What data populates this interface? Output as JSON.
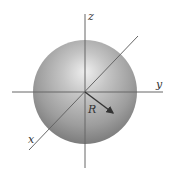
{
  "diagram": {
    "type": "sphere-with-axes",
    "labels": {
      "z_axis": "z",
      "y_axis": "y",
      "x_axis": "x",
      "radius": "R"
    },
    "colors": {
      "background": "#ffffff",
      "sphere_highlight": "#e6e6e6",
      "sphere_mid": "#a8a8a8",
      "sphere_shadow": "#7a7a7a",
      "axis_line": "#555555",
      "arrow": "#333333"
    }
  }
}
